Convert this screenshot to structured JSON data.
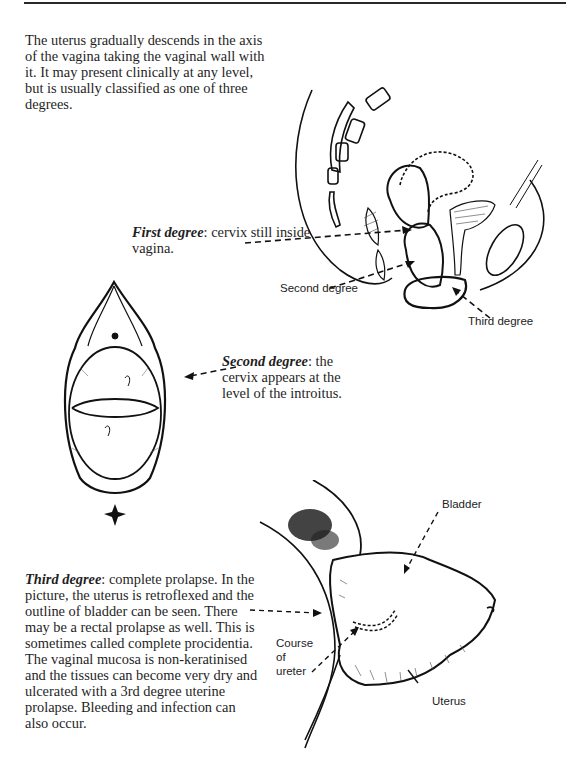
{
  "page": {
    "intro_text": "The uterus gradually descends in the axis of the vagina taking the vaginal wall with it. It may present clinically at any level, but is usually classified as one of three degrees.",
    "first_degree": {
      "term": "First degree",
      "description": ": cervix still inside vagina."
    },
    "second_degree": {
      "term": "Second degree",
      "description": ": the cervix appears at the level of the introitus."
    },
    "third_degree": {
      "term": "Third degree",
      "description": ": complete prolapse. In the picture, the uterus is retroflexed and the outline of bladder can be seen. There may be a rectal prolapse as well. This is sometimes called complete procidentia. The vaginal mucosa is non-keratinised and the tissues can become very dry and ulcerated with a 3rd degree uterine prolapse. Bleeding and infection can also occur."
    }
  },
  "figures": {
    "sagittal_diagram": {
      "labels": {
        "second_degree": "Second degree",
        "third_degree": "Third degree"
      }
    },
    "introitus_view": {},
    "procidentia_view": {
      "labels": {
        "bladder": "Bladder",
        "course_of_ureter_line1": "Course",
        "course_of_ureter_line2": "of",
        "course_of_ureter_line3": "ureter",
        "uterus": "Uterus"
      }
    }
  },
  "colors": {
    "ink": "#1a1a1a",
    "rule": "#2a2a2a",
    "background": "#ffffff"
  }
}
